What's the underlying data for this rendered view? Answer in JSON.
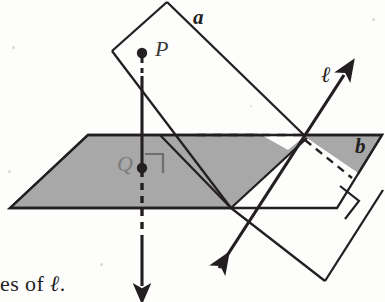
{
  "figure": {
    "type": "geometry-diagram",
    "background_color": "#fdfdfc",
    "ink_color": "#231f20",
    "plane_fill_color": "#a8a8a8",
    "labels": {
      "plane_a": "a",
      "plane_b": "b",
      "point_p": "P",
      "point_q": "Q",
      "line_l": "ℓ"
    },
    "caption_fragment": {
      "prefix": "es of ",
      "symbol": "ℓ",
      "suffix": "."
    },
    "elements": {
      "plane_a_name": "tilted-plane-a",
      "plane_b_name": "horizontal-plane-b",
      "point_p_name": "point-p",
      "point_q_name": "point-q",
      "line_l_name": "line-l",
      "perpendicular_segment_name": "segment-pq-perpendicular",
      "right_angle_marker_q": "right-angle-marker-at-q",
      "right_angle_marker_edge": "right-angle-marker-plane-edge",
      "dashed_horizontal": "hidden-edge-dashed",
      "dashed_diagonal": "hidden-edge-dashed-right"
    },
    "geometry": {
      "plane_a_polygon": "167,2 305,136 325,281 112,51",
      "plane_a_lower_polygon": "305,136 383,190 325,281",
      "plane_b_polygon": "88,135 382,135 337,208 10,208",
      "point_p": [
        142,
        52
      ],
      "point_q": [
        142,
        168
      ],
      "line_l_start": [
        216,
        272
      ],
      "line_l_end": [
        348,
        70
      ],
      "vertical_arrow_end": [
        142,
        291
      ]
    }
  }
}
